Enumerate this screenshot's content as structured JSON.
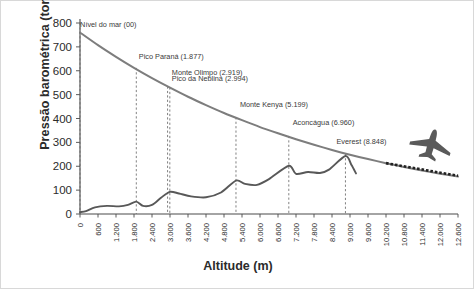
{
  "chart_data": {
    "type": "line",
    "title": "",
    "xlabel": "Altitude (m)",
    "ylabel": "Pressão barométrica (torr)",
    "xlim": [
      0,
      12600
    ],
    "ylim": [
      0,
      800
    ],
    "grid": false,
    "legend": "none",
    "xticks": [
      "0",
      "600",
      "1.200",
      "1.800",
      "2.400",
      "3.000",
      "3.600",
      "4.200",
      "4.800",
      "5.400",
      "6.000",
      "6.600",
      "7.200",
      "7.800",
      "8.400",
      "9.000",
      "9.600",
      "10.200",
      "10.800",
      "11.400",
      "12.000",
      "12.600"
    ],
    "yticks": [
      "0",
      "100",
      "200",
      "300",
      "400",
      "500",
      "600",
      "700",
      "800"
    ],
    "series": [
      {
        "name": "Pressão barométrica",
        "color": "#7d7d7d",
        "x": [
          0,
          600,
          1200,
          1800,
          2400,
          3000,
          3600,
          4200,
          4800,
          5400,
          6000,
          6600,
          7200,
          7800,
          8400,
          9000,
          9600,
          10200,
          10800,
          11400,
          12000,
          12600
        ],
        "values": [
          760,
          707,
          658,
          612,
          569,
          529,
          491,
          456,
          423,
          393,
          364,
          338,
          313,
          290,
          268,
          248,
          230,
          213,
          197,
          182,
          169,
          157
        ]
      },
      {
        "name": "Perfil do terreno",
        "color": "#585858",
        "x": [
          0,
          200,
          500,
          900,
          1300,
          1600,
          1877,
          2100,
          2400,
          2700,
          2994,
          3300,
          3700,
          4200,
          4700,
          5199,
          5500,
          5900,
          6300,
          6960,
          7200,
          7600,
          8000,
          8300,
          8848,
          9050,
          9200
        ],
        "values": [
          8,
          12,
          28,
          34,
          32,
          38,
          52,
          34,
          38,
          68,
          93,
          86,
          74,
          70,
          90,
          140,
          126,
          122,
          146,
          202,
          168,
          176,
          172,
          186,
          243,
          205,
          170
        ]
      }
    ],
    "flight_path": {
      "name": "Rota de voo comercial",
      "x_start": 10200,
      "x_end": 12600,
      "y_start": 213,
      "y_end": 160
    },
    "annotations": [
      {
        "label": "Nível do mar (00)",
        "x": 0,
        "y_top": 800,
        "text_x": 4.0,
        "text_y": 784
      },
      {
        "label": "Pico Paraná (1.877)",
        "x": 1877,
        "y_top": 612,
        "text_x": 1960,
        "text_y": 650
      },
      {
        "label": "Monte Olimpo (2.919)",
        "x": 2919,
        "y_top": 534,
        "text_x": 3060,
        "text_y": 584
      },
      {
        "label": "Pico da Neblina (2.994)",
        "x": 2994,
        "y_top": 530,
        "text_x": 3060,
        "text_y": 556
      },
      {
        "label": "Monte Kenya (5.199)",
        "x": 5199,
        "y_top": 405,
        "text_x": 5330,
        "text_y": 450
      },
      {
        "label": "Aconcágua (6.960)",
        "x": 6960,
        "y_top": 327,
        "text_x": 7090,
        "text_y": 372
      },
      {
        "label": "Everest (8.848)",
        "x": 8848,
        "y_top": 252,
        "text_x": 8550,
        "text_y": 292
      }
    ],
    "icons": [
      {
        "name": "airplane-icon",
        "x": 11700,
        "y": 290
      }
    ]
  }
}
